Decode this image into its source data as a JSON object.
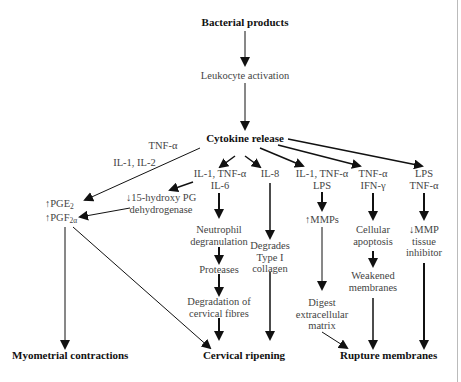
{
  "diagram": {
    "nodes": {
      "bacterial_products": "Bacterial products",
      "leukocyte_activation": "Leukocyte activation",
      "cytokine_release": "Cytokine release",
      "tnf_alpha_label": "TNF-α",
      "il1_il2_label": "IL-1, IL-2",
      "pge2": "↑PGE",
      "pge2_sub": "2",
      "pgf2a": "↑PGF",
      "pgf2a_sub": "2α",
      "hydroxy_pg_1": "↓15-hydroxy PG",
      "hydroxy_pg_2": "dehydrogenase",
      "il1_tnf_il6_1": "IL-1, TNF-α",
      "il1_tnf_il6_2": "IL-6",
      "il8": "IL-8",
      "il1_tnf_lps_1": "IL-1, TNF-α",
      "il1_tnf_lps_2": "LPS",
      "tnf_ifn_1": "TNF-α",
      "tnf_ifn_2": "IFN-γ",
      "lps_tnf_1": "LPS",
      "lps_tnf_2": "TNF-α",
      "neutrophil_1": "Neutrophil",
      "neutrophil_2": "degranulation",
      "proteases": "Proteases",
      "degradation_1": "Degradation of",
      "degradation_2": "cervical fibres",
      "degrades_1": "Degrades",
      "degrades_2": "Type I",
      "degrades_3": "collagen",
      "mmps": "↑MMPs",
      "digest_1": "Digest",
      "digest_2": "extracellular",
      "digest_3": "matrix",
      "apoptosis_1": "Cellular",
      "apoptosis_2": "apoptosis",
      "weakened_1": "Weakened",
      "weakened_2": "membranes",
      "mmp_inhib_1": "↓MMP",
      "mmp_inhib_2": "tissue",
      "mmp_inhib_3": "inhibitor",
      "myometrial_contractions": "Myometrial contractions",
      "cervical_ripening": "Cervical ripening",
      "rupture_membranes": "Rupture membranes"
    },
    "colors": {
      "arrow": "#111111",
      "text": "#444444",
      "bold_text": "#111111",
      "background": "#ffffff"
    }
  }
}
